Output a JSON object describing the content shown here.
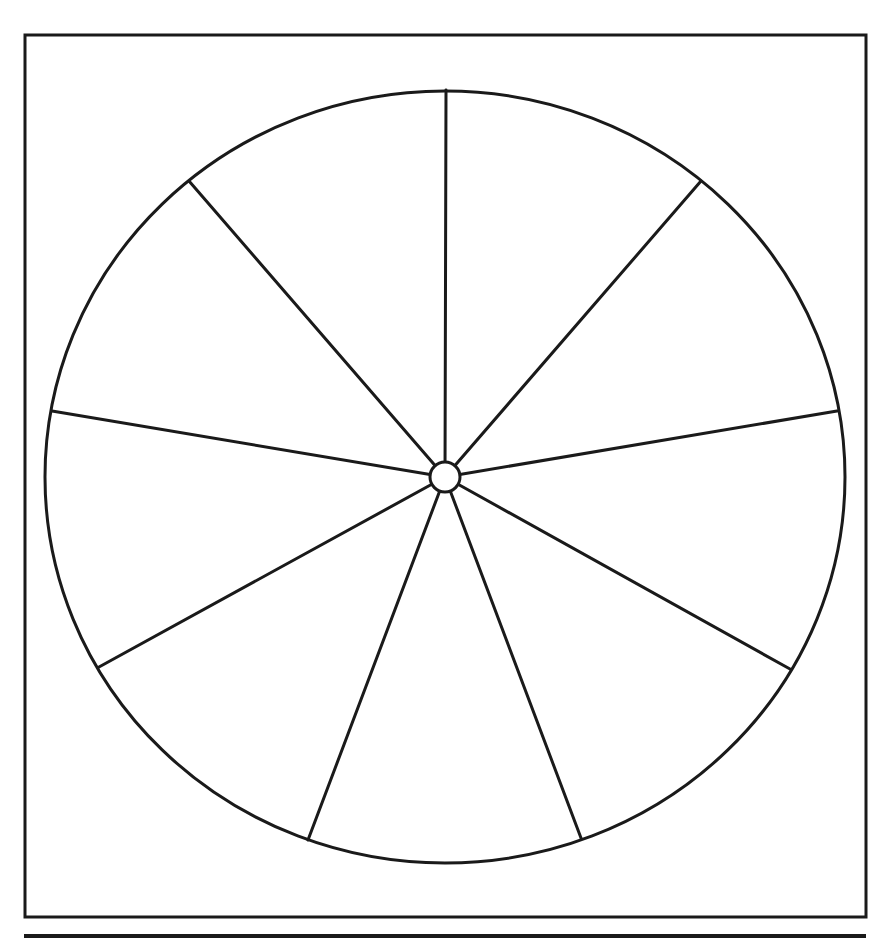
{
  "diagram": {
    "type": "segmented-wheel-template",
    "segment_count": 10,
    "labels": [],
    "colors": {
      "background": "#ffffff",
      "stroke": "#1a1a1a"
    },
    "frame": {
      "x": 25,
      "y": 35,
      "width": 841,
      "height": 882,
      "stroke_width": 3
    },
    "bottom_rule": {
      "x": 24,
      "y": 934,
      "width": 842,
      "height": 5
    },
    "wheel": {
      "cx": 445,
      "cy": 477,
      "rx": 400,
      "ry": 386,
      "stroke_width": 3,
      "hub_radius": 15
    },
    "spokes": [
      {
        "name": "spoke-top",
        "x": 446,
        "y": 90
      },
      {
        "name": "spoke-upper-right",
        "x": 701,
        "y": 181
      },
      {
        "name": "spoke-right",
        "x": 837,
        "y": 411
      },
      {
        "name": "spoke-lower-right",
        "x": 790,
        "y": 669
      },
      {
        "name": "spoke-bottom-right",
        "x": 581,
        "y": 838
      },
      {
        "name": "spoke-bottom-left",
        "x": 308,
        "y": 840
      },
      {
        "name": "spoke-lower-left",
        "x": 99,
        "y": 667
      },
      {
        "name": "spoke-left",
        "x": 52,
        "y": 411
      },
      {
        "name": "spoke-upper-left",
        "x": 189,
        "y": 181
      }
    ]
  }
}
